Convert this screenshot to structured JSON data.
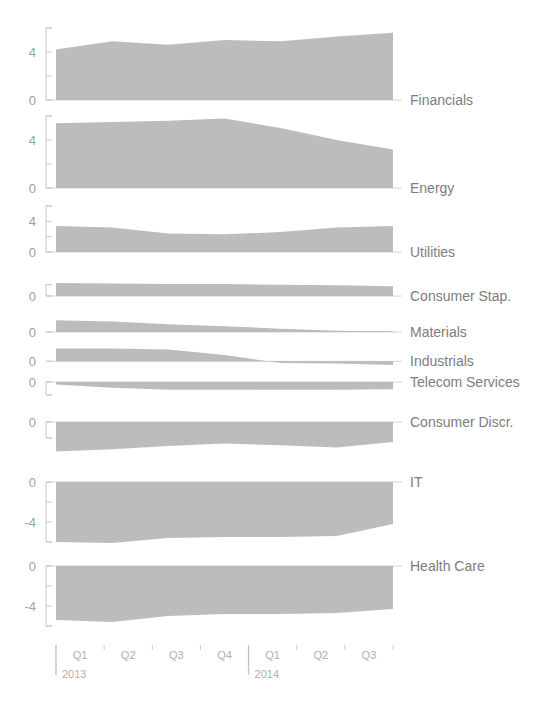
{
  "title": "",
  "chart_data": {
    "type": "area",
    "title": "",
    "subtitle": "",
    "xlabel": "",
    "ylabel": "",
    "grid": false,
    "legend": "right-inline-labels",
    "x": [
      "Q1 2013",
      "Q2 2013",
      "Q3 2013",
      "Q4 2013",
      "Q1 2014",
      "Q2 2014",
      "Q3 2014"
    ],
    "x_quarters": [
      "Q1",
      "Q2",
      "Q3",
      "Q4",
      "Q1",
      "Q2",
      "Q3"
    ],
    "x_years": [
      "2013",
      "2014"
    ],
    "panels": [
      {
        "name": "Financials",
        "ylim": [
          0,
          6
        ],
        "yticks": [
          0,
          2,
          4,
          6
        ],
        "ytick_labels": [
          "0",
          "",
          "4",
          ""
        ],
        "values": [
          4.2,
          4.9,
          4.6,
          5.0,
          4.9,
          5.3,
          5.6
        ]
      },
      {
        "name": "Energy",
        "ylim": [
          0,
          6
        ],
        "yticks": [
          0,
          2,
          4,
          6
        ],
        "ytick_labels": [
          "0",
          "",
          "4",
          ""
        ],
        "values": [
          5.4,
          5.5,
          5.6,
          5.8,
          5.0,
          4.0,
          3.2
        ]
      },
      {
        "name": "Utilities",
        "ylim": [
          0,
          6
        ],
        "yticks": [
          0,
          2,
          4,
          6
        ],
        "ytick_labels": [
          "0",
          "",
          "4",
          ""
        ],
        "values": [
          3.4,
          3.2,
          2.4,
          2.3,
          2.6,
          3.2,
          3.4
        ]
      },
      {
        "name": "Consumer Stap.",
        "ylim": [
          0,
          6
        ],
        "yticks": [
          0,
          2
        ],
        "ytick_labels": [
          "0",
          ""
        ],
        "values": [
          2.3,
          2.2,
          2.1,
          2.1,
          2.0,
          1.9,
          1.7
        ]
      },
      {
        "name": "Materials",
        "ylim": [
          0,
          2
        ],
        "yticks": [
          0
        ],
        "ytick_labels": [
          "0"
        ],
        "values": [
          0.9,
          0.8,
          0.6,
          0.45,
          0.25,
          0.1,
          0.05
        ]
      },
      {
        "name": "Industrials",
        "ylim": [
          -1,
          2
        ],
        "yticks": [
          0
        ],
        "ytick_labels": [
          "0"
        ],
        "values": [
          1.2,
          1.2,
          1.1,
          0.6,
          -0.15,
          -0.2,
          -0.35
        ]
      },
      {
        "name": "Telecom Services",
        "ylim": [
          -2,
          0
        ],
        "yticks": [
          0,
          -1
        ],
        "ytick_labels": [
          "0",
          ""
        ],
        "values": [
          -0.2,
          -0.45,
          -0.6,
          -0.6,
          -0.6,
          -0.6,
          -0.55
        ]
      },
      {
        "name": "Consumer Discr.",
        "ylim": [
          -3,
          0
        ],
        "yticks": [
          0,
          -1
        ],
        "ytick_labels": [
          "0",
          ""
        ],
        "values": [
          -1.85,
          -1.7,
          -1.5,
          -1.35,
          -1.45,
          -1.6,
          -1.25
        ]
      },
      {
        "name": "IT",
        "ylim": [
          -7,
          0
        ],
        "yticks": [
          0,
          -2,
          -4,
          -6
        ],
        "ytick_labels": [
          "0",
          "",
          "-4",
          ""
        ],
        "values": [
          -6.0,
          -6.1,
          -5.6,
          -5.5,
          -5.5,
          -5.4,
          -4.2
        ]
      },
      {
        "name": "Health Care",
        "ylim": [
          -7,
          0
        ],
        "yticks": [
          0,
          -2,
          -4,
          -6
        ],
        "ytick_labels": [
          "0",
          "",
          "-4",
          ""
        ],
        "values": [
          -5.4,
          -5.6,
          -5.0,
          -4.8,
          -4.8,
          -4.7,
          -4.3
        ]
      }
    ]
  },
  "axis": {
    "q_labels": [
      "Q1",
      "Q2",
      "Q3",
      "Q4",
      "Q1",
      "Q2",
      "Q3"
    ],
    "year_2013": "2013",
    "year_2014": "2014"
  },
  "colors": {
    "area_fill": "#b6b6b6",
    "axis": "#c9c9c9",
    "text": "#9a9a9a",
    "label": "#7d7d7d",
    "background": "#ffffff"
  }
}
